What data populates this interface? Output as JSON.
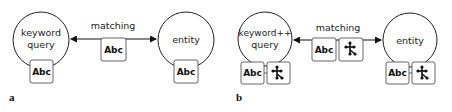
{
  "panel_a": {
    "label": "a",
    "left_node": {
      "line1": "keyword",
      "line2": "query",
      "boxes": [
        "Abc"
      ]
    },
    "right_node": {
      "label": "entity",
      "boxes": [
        "Abc"
      ]
    },
    "edge": {
      "label": "matching",
      "boxes": [
        "Abc"
      ],
      "arrow": "bidirectional"
    }
  },
  "panel_b": {
    "label": "b",
    "left_node": {
      "line1": "keyword++",
      "line2": "query",
      "boxes": [
        "Abc",
        "graph-icon"
      ]
    },
    "right_node": {
      "label": "entity",
      "boxes": [
        "Abc",
        "graph-icon"
      ]
    },
    "edge": {
      "label": "matching",
      "boxes": [
        "Abc",
        "graph-icon"
      ],
      "arrow": "bidirectional"
    }
  }
}
